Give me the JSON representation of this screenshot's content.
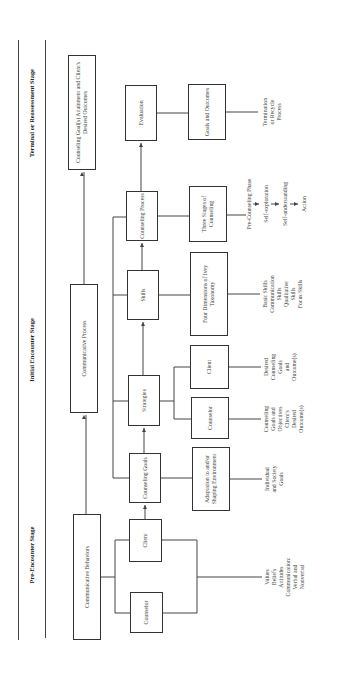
{
  "stages": [
    {
      "label": "Pre-Encounter Stage"
    },
    {
      "label": "Initial Encounter Stage"
    },
    {
      "label": "Terminal or Reassessment Stage"
    }
  ],
  "top_row": {
    "communicative_behaviors": "Communicative Behaviors",
    "communicative_process": "Communicative Process",
    "attainment": "Counseling Goal(s) Attainment and Client's Desired Outcomes"
  },
  "middle_row": {
    "counselor": "Counselor",
    "client": "Client",
    "counseling_goals": "Counseling Goals",
    "strategies": "Strategies",
    "skills": "Skills",
    "counseling_process": "Counseling Process",
    "evaluation": "Evaluation"
  },
  "lower_row": {
    "adaptation": "Adaptation to and/or Shaping Environment",
    "counselor": "Counselor",
    "client": "Client",
    "four_dimensions": "Four Dimensions of Ivey Taxonomy",
    "three_stages": "Three Stages of Counseling",
    "goals_outcomes": "Goals and Outcomes"
  },
  "notes": {
    "values": "Values\nBeliefs\nAttitudes\nCommunication:\nVerbal and\nNonverbal",
    "individual_goals": "Individual\nand Society\nGoals",
    "counselor_goals": "Counseling\nGoals and\nObjectives\nClient's\nDesired\nOutcome(s)",
    "client_goals": "Desired\nCounseling\nGoals\nand\nOutcome(s)",
    "skills_list": "Basic Skills\nCommunication\nSkills\nQualitative\nSkills\nFocus Skills",
    "termination": "Termination\nor Recycle\nProcess"
  },
  "counseling_phases": [
    "Pre-Counseling Phase",
    "Self-exploration",
    "Self-understanding",
    "Action"
  ]
}
